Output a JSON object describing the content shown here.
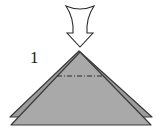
{
  "diagram": {
    "step_number": "1",
    "colors": {
      "paper_fill": "#a9a9a9",
      "paper_back_fill": "#9c9c9c",
      "outline": "#3a3a3a",
      "arrow_fill": "#ffffff",
      "arrow_stroke": "#2a2a2a",
      "fold_line": "#2a2a2a"
    },
    "elements": [
      {
        "type": "push-arrow",
        "direction": "down"
      },
      {
        "type": "paper-layer",
        "shape": "triangle",
        "layer": "back"
      },
      {
        "type": "paper-layer",
        "shape": "triangle",
        "layer": "front"
      },
      {
        "type": "fold-line",
        "style": "mountain (dash-dot)"
      }
    ]
  }
}
